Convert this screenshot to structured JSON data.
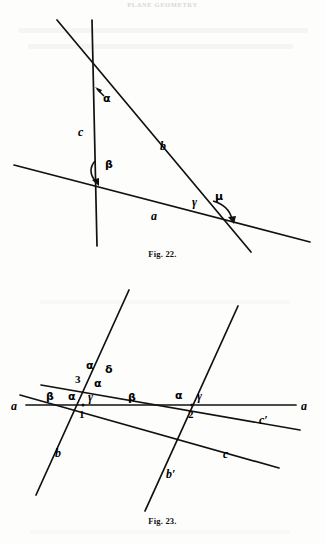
{
  "page": {
    "running_head": "PLANE GEOMETRY",
    "background": "#fdfdfc",
    "ink": "#111111"
  },
  "figures": [
    {
      "id": "fig22",
      "caption": "Fig. 22.",
      "description": "Three straight lines a, b, c meeting pairwise, with marked angles alpha, beta, gamma, mu.",
      "line_labels": [
        {
          "name": "c",
          "text": "c"
        },
        {
          "name": "b",
          "text": "b"
        },
        {
          "name": "a",
          "text": "a"
        }
      ],
      "angle_labels": [
        {
          "name": "alpha",
          "text": "α"
        },
        {
          "name": "beta",
          "text": "β"
        },
        {
          "name": "gamma",
          "text": "γ"
        },
        {
          "name": "mu",
          "text": "μ"
        }
      ]
    },
    {
      "id": "fig23",
      "caption": "Fig. 23.",
      "description": "Transversal a crossed by parallels b, b' and c, c' at points 1 and 2, with angles alpha, beta, gamma, delta and angle 3.",
      "line_labels": [
        {
          "name": "a-left",
          "text": "a"
        },
        {
          "name": "a-right",
          "text": "a"
        },
        {
          "name": "b",
          "text": "b"
        },
        {
          "name": "b-prime",
          "text": "b′"
        },
        {
          "name": "c",
          "text": "c"
        },
        {
          "name": "c-prime",
          "text": "c′"
        }
      ],
      "point_labels": [
        {
          "name": "point-1",
          "text": "1"
        },
        {
          "name": "point-2",
          "text": "2"
        },
        {
          "name": "angle-3",
          "text": "3"
        }
      ],
      "angle_labels": [
        {
          "name": "alpha-upper",
          "text": "α"
        },
        {
          "name": "delta-upper",
          "text": "δ"
        },
        {
          "name": "alpha-mid",
          "text": "α"
        },
        {
          "name": "beta-left",
          "text": "β"
        },
        {
          "name": "alpha-p1",
          "text": "α"
        },
        {
          "name": "gamma-p1",
          "text": "γ"
        },
        {
          "name": "beta-mid",
          "text": "β"
        },
        {
          "name": "alpha-p2",
          "text": "α"
        },
        {
          "name": "gamma-p2",
          "text": "γ"
        }
      ]
    }
  ]
}
